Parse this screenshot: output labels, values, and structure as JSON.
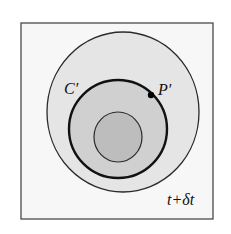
{
  "diagram": {
    "frame": {
      "x": 21,
      "y": 23,
      "width": 192,
      "height": 196,
      "stroke": "#4a4a4a",
      "fill": "#f7f7f7"
    },
    "circles": [
      {
        "name": "outer-region",
        "cx": 123,
        "cy": 112,
        "rx": 76,
        "ry": 80,
        "fill": "#e5e5e5",
        "stroke": "#2a2a2a",
        "stroke_width": 1.3
      },
      {
        "name": "curve-c-prime",
        "cx": 118,
        "cy": 129,
        "rx": 49,
        "ry": 49,
        "fill": "#d0d0d0",
        "stroke": "#111111",
        "stroke_width": 2.4
      },
      {
        "name": "inner-region",
        "cx": 118,
        "cy": 137,
        "rx": 24,
        "ry": 25,
        "fill": "#bdbdbd",
        "stroke": "#2a2a2a",
        "stroke_width": 1.2
      }
    ],
    "point": {
      "cx": 151,
      "cy": 95,
      "r": 3.2,
      "fill": "#000000"
    },
    "labels": {
      "curve": "C′",
      "point": "P′",
      "time": "t+δt"
    }
  }
}
